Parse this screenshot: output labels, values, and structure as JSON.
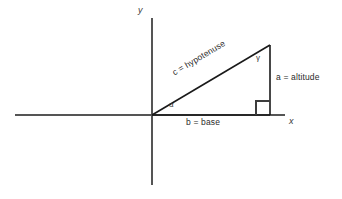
{
  "figure": {
    "background_color": "#ffffff",
    "axis_color": "#555555",
    "triangle_color": "#1a1a1a",
    "text_color": "#2b2b2b"
  },
  "axes": {
    "x_axis_label": "x",
    "y_axis_label": "y",
    "origin": {
      "x": 152,
      "y": 115
    },
    "x_axis": {
      "x1": 15,
      "y1": 115,
      "x2": 285,
      "y2": 115
    },
    "y_axis": {
      "x1": 152,
      "y1": 18,
      "x2": 152,
      "y2": 185
    }
  },
  "triangle": {
    "vertices": {
      "origin": {
        "x": 152,
        "y": 115
      },
      "base_right": {
        "x": 270,
        "y": 115
      },
      "apex": {
        "x": 270,
        "y": 45
      }
    },
    "right_angle_marker": {
      "x": 256,
      "y": 101,
      "size": 14
    },
    "angles": [
      {
        "name": "alpha",
        "symbol": "α",
        "vertex": "origin"
      },
      {
        "name": "gamma",
        "symbol": "γ",
        "vertex": "apex"
      }
    ],
    "sides": [
      {
        "name": "hypotenuse",
        "label": "c = hypotenuse",
        "letter": "c",
        "rotation_deg": -30.7
      },
      {
        "name": "altitude",
        "label": "a = altitude",
        "letter": "a"
      },
      {
        "name": "base",
        "label": "b = base",
        "letter": "b"
      }
    ]
  }
}
